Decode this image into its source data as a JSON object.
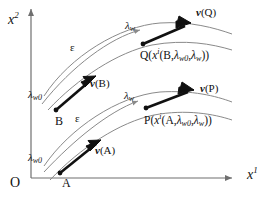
{
  "figure": {
    "type": "vector-field-diagram",
    "background_color": "#ffffff",
    "ink_color": "#111111",
    "thin_curve_color": "#8a8a8a"
  },
  "axes": {
    "y_label": "x",
    "y_superscript": "2",
    "x_label": "x",
    "x_superscript": "1",
    "origin_label": "O"
  },
  "points": {
    "A": {
      "name": "A",
      "start_lambda_label": "λ",
      "start_lambda_sub": "w0"
    },
    "B": {
      "name": "B",
      "start_lambda_label": "λ",
      "start_lambda_sub": "w0"
    },
    "P": {
      "name": "P",
      "expr_prefix": "P",
      "expr_open": "(",
      "expr_x": "x",
      "expr_x_sup": "i",
      "expr_inner_open": "(",
      "expr_base_point": "A",
      "expr_comma1": ",",
      "expr_lam1": "λ",
      "expr_lam1_sub": "w0",
      "expr_comma2": ",",
      "expr_lam2": "λ",
      "expr_lam2_sub": "w",
      "expr_inner_close": ")",
      "expr_close": ")"
    },
    "Q": {
      "name": "Q",
      "expr_prefix": "Q",
      "expr_open": "(",
      "expr_x": "x",
      "expr_x_sup": "i",
      "expr_inner_open": "(",
      "expr_base_point": "B",
      "expr_comma1": ",",
      "expr_lam1": "λ",
      "expr_lam1_sub": "w0",
      "expr_comma2": ",",
      "expr_lam2": "λ",
      "expr_lam2_sub": "w",
      "expr_inner_close": ")",
      "expr_close": ")"
    }
  },
  "vectors": {
    "vA": {
      "glyph": "v",
      "open": "(",
      "arg": "A",
      "close": ")"
    },
    "vB": {
      "glyph": "v",
      "open": "(",
      "arg": "B",
      "close": ")"
    },
    "vP": {
      "glyph": "v",
      "open": "(",
      "arg": "P",
      "close": ")"
    },
    "vQ": {
      "glyph": "v",
      "open": "(",
      "arg": "Q",
      "close": ")"
    }
  },
  "curve_labels": {
    "lambda_upper_param": {
      "sym": "λ",
      "sub": "w"
    },
    "lambda_lower_param": {
      "sym": "λ",
      "sub": "w"
    },
    "epsilon_upper": "ε",
    "epsilon_lower": "ε"
  }
}
